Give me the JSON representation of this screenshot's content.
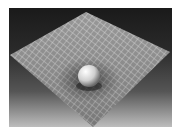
{
  "image": {
    "subject": "spacetime-curvature-illustration",
    "description": "Grid plane warped by a sphere (gravity well)",
    "colors": {
      "background_top": "#1a1a1a",
      "background_bottom": "#bdbdbd",
      "grid_surface": "#8a8a8a",
      "grid_lines": "#c8c8c8",
      "sphere": "#e6e6e6"
    }
  }
}
